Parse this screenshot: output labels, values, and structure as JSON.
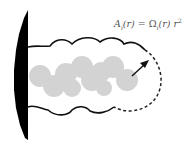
{
  "figure": {
    "formula": {
      "lhs_symbol": "A",
      "lhs_sub": "i",
      "lhs_arg": "(r)",
      "equals": " = ",
      "rhs_symbol": "Ω",
      "rhs_sub": "i",
      "rhs_arg": "(r)",
      "rhs_var": " r",
      "rhs_power": "2"
    },
    "colors": {
      "wall": "#000000",
      "envelope_line": "#111111",
      "dashed_line": "#222222",
      "blobs": "#d3d3d3",
      "arrow": "#111111",
      "background": "#ffffff"
    }
  }
}
